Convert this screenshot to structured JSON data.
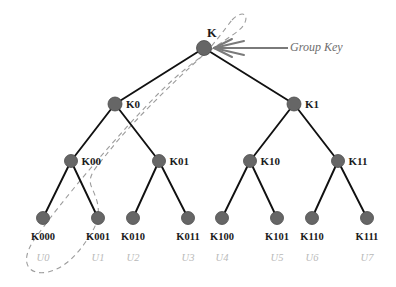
{
  "diagram": {
    "colors": {
      "node_fill": "#666666",
      "node_stroke": "#4a4a4a",
      "edge": "#111111",
      "dashed_path": "#9c9c9c",
      "arrow": "#7a7a7a",
      "key_label": "#1c1c1c",
      "user_label": "#b9b9b9",
      "annotation": "#6e6e6e",
      "background": "#ffffff"
    },
    "annotation": {
      "text": "Group Key",
      "arrow_from": {
        "x": 288,
        "y": 48
      },
      "arrow_to": {
        "x": 214,
        "y": 48
      }
    },
    "nodes": [
      {
        "id": "K",
        "label": "K",
        "x": 204,
        "y": 48,
        "r": 7.5,
        "level": 0,
        "label_pos": "above"
      },
      {
        "id": "K0",
        "label": "K0",
        "x": 115,
        "y": 104,
        "r": 7,
        "level": 1,
        "label_pos": "right"
      },
      {
        "id": "K1",
        "label": "K1",
        "x": 294,
        "y": 104,
        "r": 7,
        "level": 1,
        "label_pos": "right"
      },
      {
        "id": "K00",
        "label": "K00",
        "x": 71,
        "y": 161,
        "r": 6.5,
        "level": 2,
        "label_pos": "right"
      },
      {
        "id": "K01",
        "label": "K01",
        "x": 159,
        "y": 161,
        "r": 6.5,
        "level": 2,
        "label_pos": "right"
      },
      {
        "id": "K10",
        "label": "K10",
        "x": 250,
        "y": 161,
        "r": 6.5,
        "level": 2,
        "label_pos": "right"
      },
      {
        "id": "K11",
        "label": "K11",
        "x": 338,
        "y": 161,
        "r": 6.5,
        "level": 2,
        "label_pos": "right"
      }
    ],
    "leaves": [
      {
        "id": "K000",
        "label": "K000",
        "user": "U0",
        "x": 43,
        "y": 218,
        "r": 6.5
      },
      {
        "id": "K001",
        "label": "K001",
        "user": "U1",
        "x": 98,
        "y": 218,
        "r": 6.5
      },
      {
        "id": "K010",
        "label": "K010",
        "user": "U2",
        "x": 133,
        "y": 218,
        "r": 6.5
      },
      {
        "id": "K011",
        "label": "K011",
        "user": "U3",
        "x": 188,
        "y": 218,
        "r": 6.5
      },
      {
        "id": "K100",
        "label": "K100",
        "user": "U4",
        "x": 222,
        "y": 218,
        "r": 6.5
      },
      {
        "id": "K101",
        "label": "K101",
        "user": "U5",
        "x": 277,
        "y": 218,
        "r": 6.5
      },
      {
        "id": "K110",
        "label": "K110",
        "user": "U6",
        "x": 312,
        "y": 218,
        "r": 6.5
      },
      {
        "id": "K111",
        "label": "K111",
        "user": "U7",
        "x": 367,
        "y": 218,
        "r": 6.5
      }
    ],
    "edges": [
      {
        "from": "K",
        "to": "K0"
      },
      {
        "from": "K",
        "to": "K1"
      },
      {
        "from": "K0",
        "to": "K00"
      },
      {
        "from": "K0",
        "to": "K01"
      },
      {
        "from": "K1",
        "to": "K10"
      },
      {
        "from": "K1",
        "to": "K11"
      },
      {
        "from": "K00",
        "to": "K000"
      },
      {
        "from": "K00",
        "to": "K001"
      },
      {
        "from": "K01",
        "to": "K010"
      },
      {
        "from": "K01",
        "to": "K011"
      },
      {
        "from": "K10",
        "to": "K100"
      },
      {
        "from": "K10",
        "to": "K101"
      },
      {
        "from": "K11",
        "to": "K110"
      },
      {
        "from": "K11",
        "to": "K111"
      }
    ],
    "highlight_path": {
      "description": "dashed loop enclosing K, K0, K00, K000",
      "enclosed_nodes": [
        "K",
        "K0",
        "K00",
        "K000"
      ],
      "dash_pattern": "5,4",
      "path": "M 232 20 C 244 8 250 16 243 26 C 236 36 200 52 160 92 C 120 132 62 200 34 240 C 18 264 30 276 48 272 C 66 268 80 252 92 232 C 104 212 96 198 92 188 C 86 176 96 168 110 150 C 132 122 176 80 200 58 C 214 45 224 30 232 20 Z"
    }
  }
}
